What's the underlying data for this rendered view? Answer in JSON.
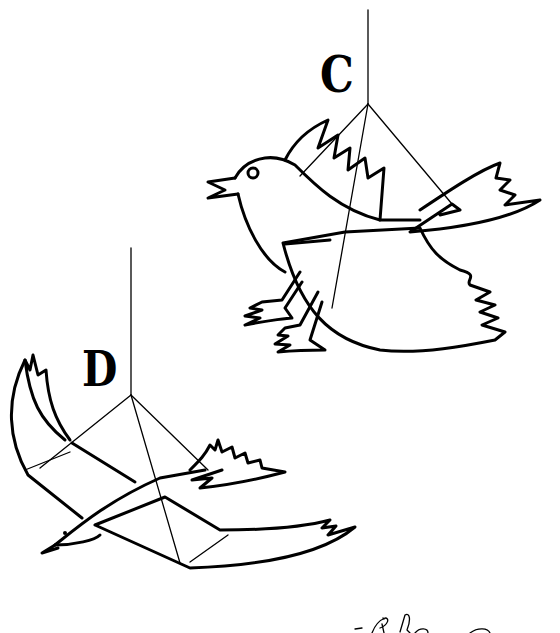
{
  "illustration": {
    "description": "Line drawing of two hanging bird mobiles",
    "figures": [
      {
        "id": "C",
        "label": "C",
        "subject": "perched songbird hanging from a string with wire frame"
      },
      {
        "id": "D",
        "label": "D",
        "subject": "flying bird with spread wings hanging from a string with wire frame"
      }
    ],
    "footer_handwriting": "partially visible handwritten text (cut off)"
  },
  "colors": {
    "line": "#000000",
    "background": "#ffffff"
  }
}
